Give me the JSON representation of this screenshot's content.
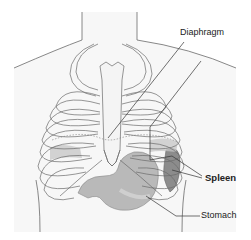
{
  "figure": {
    "labels": [
      {
        "id": "diaphragm",
        "text": "Diaphragm",
        "bold": false
      },
      {
        "id": "spleen",
        "text": "Spleen",
        "bold": true
      },
      {
        "id": "stomach",
        "text": "Stomach",
        "bold": false
      }
    ],
    "colors": {
      "outline": "#6a6a6a",
      "bone_fill": "#f4f4f4",
      "body_fill": "#f7f7f7",
      "organ_fill": "#b8b8b8",
      "spleen_fill": "#8c8c8c",
      "leader_line": "#333333"
    }
  }
}
